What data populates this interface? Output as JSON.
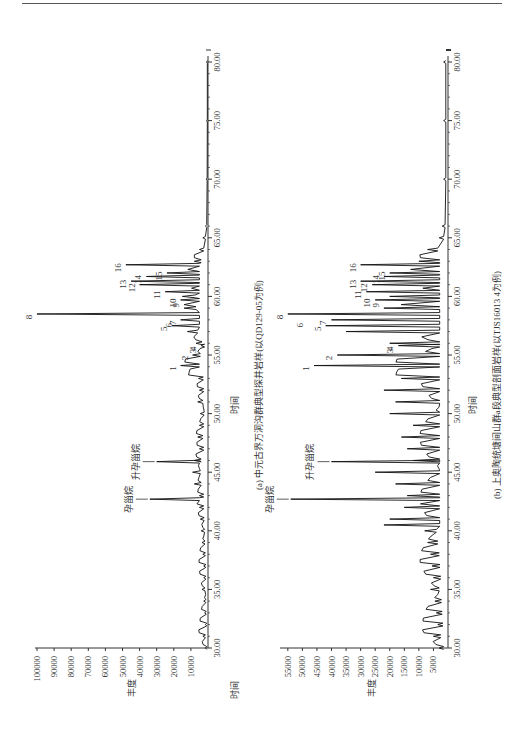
{
  "page": {
    "top_rule": true
  },
  "charts": [
    {
      "id": "a",
      "caption": "(a) 中元古界万洞沟群典型探井岩样(以QD129-05为例)",
      "xlabel": "时间",
      "ylabel": "丰度",
      "x_ticks": [
        "30.00",
        "35.00",
        "40.00",
        "45.00",
        "50.00",
        "55.00",
        "60.00",
        "65.00",
        "70.00",
        "75.00",
        "80.00"
      ],
      "y_ticks": [
        "10000",
        "20000",
        "30000",
        "40000",
        "50000",
        "60000",
        "70000",
        "80000",
        "90000",
        "100000"
      ],
      "compound_labels": {
        "pregnane": "孕甾烷",
        "homopregnane": "升孕甾烷"
      },
      "peak_labels": [
        "1",
        "2",
        "3",
        "4",
        "5",
        "6",
        "7",
        "8",
        "9",
        "10",
        "11",
        "12",
        "13",
        "14",
        "15",
        "16"
      ]
    },
    {
      "id": "b",
      "caption": "(b) 上奥陶统塘间山群a段典型剖面岩样(以TJS16013 4为例)",
      "xlabel": "时间",
      "ylabel": "丰度",
      "x_ticks": [
        "30.00",
        "35.00",
        "40.00",
        "45.00",
        "50.00",
        "55.00",
        "60.00",
        "65.00",
        "70.00",
        "75.00",
        "80.00"
      ],
      "y_ticks": [
        "5000",
        "10000",
        "15000",
        "20000",
        "25000",
        "30000",
        "35000",
        "40000",
        "45000",
        "50000",
        "55000"
      ],
      "compound_labels": {
        "pregnane": "孕甾烷",
        "homopregnane": "升孕甾烷"
      },
      "peak_labels": [
        "1",
        "2",
        "3",
        "4",
        "5",
        "6",
        "7",
        "8",
        "9",
        "10",
        "11",
        "12",
        "13",
        "14",
        "15",
        "16"
      ]
    }
  ],
  "chart_data": [
    {
      "type": "line",
      "title": "(a) 中元古界万洞沟群典型探井岩样(以QD129-05为例)",
      "xlabel": "时间",
      "ylabel": "丰度",
      "xlim": [
        30,
        80
      ],
      "ylim": [
        0,
        100000
      ],
      "grid": false,
      "annotations": [
        {
          "label": "孕甾烷",
          "x": 42.7,
          "y": 34000
        },
        {
          "label": "升孕甾烷",
          "x": 45.9,
          "y": 30000
        },
        {
          "label": "1",
          "x": 54.1,
          "y": 16000
        },
        {
          "label": "2",
          "x": 55.0,
          "y": 9000
        },
        {
          "label": "3",
          "x": 55.6,
          "y": 4000
        },
        {
          "label": "4",
          "x": 55.8,
          "y": 4000
        },
        {
          "label": "5",
          "x": 57.5,
          "y": 21000
        },
        {
          "label": "6",
          "x": 57.8,
          "y": 18000
        },
        {
          "label": "7",
          "x": 58.0,
          "y": 16000
        },
        {
          "label": "8",
          "x": 58.5,
          "y": 100000
        },
        {
          "label": "9",
          "x": 59.5,
          "y": 14000
        },
        {
          "label": "10",
          "x": 59.7,
          "y": 16000
        },
        {
          "label": "11",
          "x": 60.4,
          "y": 25000
        },
        {
          "label": "12",
          "x": 61.0,
          "y": 40000
        },
        {
          "label": "13",
          "x": 61.3,
          "y": 45000
        },
        {
          "label": "14",
          "x": 61.7,
          "y": 36000
        },
        {
          "label": "15",
          "x": 62.0,
          "y": 24000
        },
        {
          "label": "16",
          "x": 62.7,
          "y": 48000
        }
      ],
      "x": [
        30,
        31,
        32,
        33,
        34,
        35,
        36,
        37,
        38,
        39,
        40,
        41,
        42,
        42.7,
        43,
        44,
        45,
        45.9,
        46,
        47,
        48,
        49,
        50,
        51,
        52,
        53,
        54.1,
        55,
        55.8,
        56,
        57,
        57.5,
        58,
        58.5,
        59,
        59.7,
        60,
        60.4,
        61,
        61.3,
        61.7,
        62,
        62.7,
        63,
        64,
        65,
        66,
        70,
        75,
        80
      ],
      "values": [
        1500,
        3000,
        1500,
        2000,
        2500,
        3500,
        2500,
        2500,
        3000,
        3500,
        4000,
        4500,
        5000,
        34000,
        5000,
        8000,
        9000,
        30000,
        8000,
        5000,
        6000,
        5000,
        4500,
        6000,
        5000,
        5500,
        16000,
        9000,
        4000,
        7000,
        12000,
        21000,
        16000,
        100000,
        14000,
        16000,
        15000,
        25000,
        40000,
        45000,
        36000,
        24000,
        48000,
        8000,
        5000,
        3000,
        1500,
        1000,
        800,
        800
      ]
    },
    {
      "type": "line",
      "title": "(b) 上奥陶统塘间山群a段典型剖面岩样(以TJS16013 4为例)",
      "xlabel": "时间",
      "ylabel": "丰度",
      "xlim": [
        30,
        80
      ],
      "ylim": [
        0,
        57000
      ],
      "grid": false,
      "annotations": [
        {
          "label": "孕甾烷",
          "x": 42.7,
          "y": 54000
        },
        {
          "label": "升孕甾烷",
          "x": 45.9,
          "y": 40000
        },
        {
          "label": "1",
          "x": 54.1,
          "y": 46000
        },
        {
          "label": "2",
          "x": 55.0,
          "y": 38000
        },
        {
          "label": "3",
          "x": 55.6,
          "y": 17000
        },
        {
          "label": "4",
          "x": 55.8,
          "y": 17000
        },
        {
          "label": "5",
          "x": 57.5,
          "y": 42000
        },
        {
          "label": "6",
          "x": 57.8,
          "y": 48000
        },
        {
          "label": "7",
          "x": 58.0,
          "y": 40000
        },
        {
          "label": "8",
          "x": 58.5,
          "y": 55000
        },
        {
          "label": "9",
          "x": 59.5,
          "y": 22000
        },
        {
          "label": "10",
          "x": 59.7,
          "y": 25000
        },
        {
          "label": "11",
          "x": 60.4,
          "y": 28000
        },
        {
          "label": "12",
          "x": 61.0,
          "y": 26000
        },
        {
          "label": "13",
          "x": 61.3,
          "y": 30000
        },
        {
          "label": "14",
          "x": 61.7,
          "y": 22000
        },
        {
          "label": "15",
          "x": 62.0,
          "y": 20000
        },
        {
          "label": "16",
          "x": 62.7,
          "y": 30000
        }
      ],
      "x": [
        30,
        31,
        32,
        33,
        34,
        35,
        36,
        37,
        38,
        39,
        40,
        40.5,
        41,
        42,
        42.7,
        43,
        44,
        45,
        45.9,
        46,
        47,
        48,
        49,
        50,
        51,
        52,
        53,
        54.1,
        55,
        55.8,
        56,
        57,
        57.5,
        58,
        58.5,
        59,
        59.7,
        60,
        60.4,
        61,
        61.3,
        61.7,
        62,
        62.7,
        63,
        64,
        65,
        66,
        70,
        75,
        80
      ],
      "values": [
        3000,
        5000,
        3500,
        4000,
        4500,
        6000,
        5000,
        5500,
        6000,
        7000,
        8000,
        22000,
        20000,
        15000,
        54000,
        14000,
        18000,
        25000,
        40000,
        12000,
        14000,
        16000,
        12000,
        20000,
        18000,
        22000,
        16000,
        46000,
        38000,
        17000,
        20000,
        35000,
        42000,
        40000,
        55000,
        22000,
        25000,
        20000,
        28000,
        26000,
        30000,
        22000,
        20000,
        30000,
        10000,
        7000,
        3000,
        2000,
        1500,
        1500,
        1500
      ]
    }
  ]
}
